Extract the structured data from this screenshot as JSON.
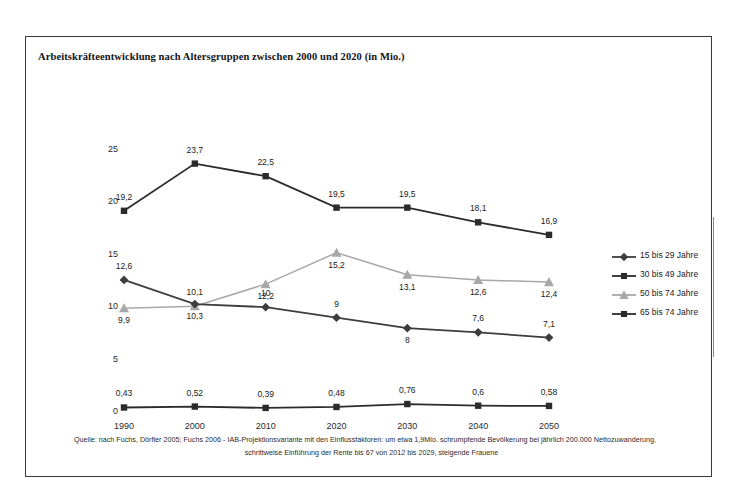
{
  "figure": {
    "title": "Arbeitskräfteentwicklung nach Altersgruppen zwischen 2000 und 2020 (in Mio.)",
    "source_line_1": "Quelle: nach Fuchs, Dörfler 2005; Fuchs 2006 - IAB-Projektionsvariante mit den Einflussfaktoren: um etwa 1,9Mio. schrumpfende Bevölkerung bei jährlich 200.000 Nettozuwanderung,",
    "source_line_2": "schrittweise  Einführung der Rente bis 67 von 2012 bis 2029, steigende Frauene"
  },
  "chart_data": {
    "type": "line",
    "title": "Arbeitskräfteentwicklung nach Altersgruppen zwischen 2000 und 2020 (in Mio.)",
    "xlabel": "",
    "ylabel": "",
    "categories": [
      "1990",
      "2000",
      "2010",
      "2020",
      "2030",
      "2040",
      "2050"
    ],
    "ylim": [
      0,
      25
    ],
    "yticks": [
      "0",
      "5",
      "10",
      "15",
      "20",
      "25"
    ],
    "grid": false,
    "legend_position": "right",
    "series": [
      {
        "name": "15 bis 29 Jahre",
        "marker": "diamond",
        "color": "#3d3d3d",
        "values": [
          12.6,
          10.3,
          10,
          9,
          8,
          7.6,
          7.1
        ],
        "labels": [
          "12,6",
          "10,3",
          "10",
          "9",
          "8",
          "7,6",
          "7,1"
        ],
        "label_positions": [
          "above",
          "below",
          "above",
          "above",
          "below",
          "above",
          "above"
        ]
      },
      {
        "name": "30 bis 49 Jahre",
        "marker": "square",
        "color": "#2b2b2b",
        "values": [
          19.2,
          23.7,
          22.5,
          19.5,
          19.5,
          18.1,
          16.9
        ],
        "labels": [
          "19,2",
          "23,7",
          "22,5",
          "19,5",
          "19,5",
          "18,1",
          "16,9"
        ],
        "label_positions": [
          "above",
          "above",
          "above",
          "above",
          "above",
          "above",
          "above"
        ]
      },
      {
        "name": "50 bis 74 Jahre",
        "marker": "triangle",
        "color": "#a8a8a8",
        "values": [
          9.9,
          10.1,
          12.2,
          15.2,
          13.1,
          12.6,
          12.4
        ],
        "labels": [
          "9,9",
          "10,1",
          "12,2",
          "15,2",
          "13,1",
          "12,6",
          "12,4"
        ],
        "label_positions": [
          "below",
          "above",
          "below",
          "below",
          "below",
          "below",
          "below"
        ]
      },
      {
        "name": "65 bis 74 Jahre",
        "marker": "square",
        "color": "#2b2b2b",
        "values": [
          0.43,
          0.52,
          0.39,
          0.48,
          0.76,
          0.6,
          0.58
        ],
        "labels": [
          "0,43",
          "0,52",
          "0,39",
          "0,48",
          "0,76",
          "0,6",
          "0,58"
        ],
        "label_positions": [
          "above",
          "above",
          "above",
          "above",
          "above",
          "above",
          "above"
        ]
      }
    ]
  },
  "legend": {
    "items": [
      {
        "label": "15 bis 29 Jahre",
        "marker": "diamond",
        "color": "#3d3d3d"
      },
      {
        "label": "30 bis 49 Jahre",
        "marker": "square",
        "color": "#2b2b2b"
      },
      {
        "label": "50 bis 74 Jahre",
        "marker": "triangle",
        "color": "#a8a8a8"
      },
      {
        "label": "65 bis 74 Jahre",
        "marker": "square",
        "color": "#2b2b2b"
      }
    ]
  }
}
